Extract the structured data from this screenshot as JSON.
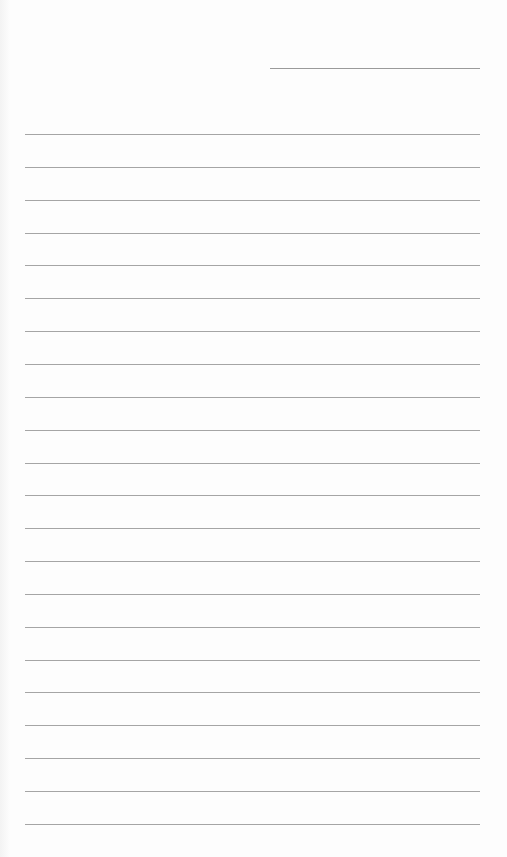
{
  "document": {
    "type": "lined-paper",
    "date_line": {
      "text": ""
    },
    "lines": [
      "",
      "",
      "",
      "",
      "",
      "",
      "",
      "",
      "",
      "",
      "",
      "",
      "",
      "",
      "",
      "",
      "",
      "",
      "",
      "",
      "",
      ""
    ],
    "line_color": "#a5a5a5",
    "background": "#fdfdfd"
  }
}
